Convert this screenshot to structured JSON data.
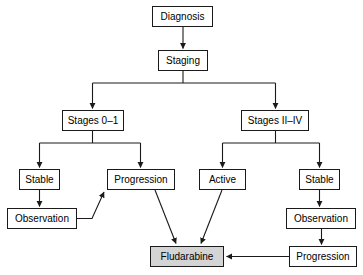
{
  "diagram": {
    "type": "flowchart",
    "colors": {
      "node_fill": "#ffffff",
      "node_fill_highlight": "#d4d4d4",
      "stroke": "#1a1a1a",
      "text": "#000000",
      "background": "#ffffff"
    },
    "nodes": [
      {
        "id": "diagnosis",
        "label": "Diagnosis",
        "x": 152,
        "y": 6,
        "w": 61,
        "h": 21,
        "shaded": false
      },
      {
        "id": "staging",
        "label": "Staging",
        "x": 158,
        "y": 50,
        "w": 50,
        "h": 21,
        "shaded": false
      },
      {
        "id": "stages01",
        "label": "Stages 0–1",
        "x": 62,
        "y": 110,
        "w": 62,
        "h": 21,
        "shaded": false
      },
      {
        "id": "stages2to4",
        "label": "Stages II–IV",
        "x": 241,
        "y": 110,
        "w": 68,
        "h": 21,
        "shaded": false
      },
      {
        "id": "stable-left",
        "label": "Stable",
        "x": 19,
        "y": 169,
        "w": 41,
        "h": 21,
        "shaded": false
      },
      {
        "id": "progression-left",
        "label": "Progression",
        "x": 107,
        "y": 169,
        "w": 68,
        "h": 21,
        "shaded": false
      },
      {
        "id": "active",
        "label": "Active",
        "x": 199,
        "y": 169,
        "w": 47,
        "h": 21,
        "shaded": false
      },
      {
        "id": "stable-right",
        "label": "Stable",
        "x": 299,
        "y": 169,
        "w": 41,
        "h": 21,
        "shaded": false
      },
      {
        "id": "observation-left",
        "label": "Observation",
        "x": 7,
        "y": 208,
        "w": 70,
        "h": 21,
        "shaded": false
      },
      {
        "id": "observation-right",
        "label": "Observation",
        "x": 286,
        "y": 208,
        "w": 70,
        "h": 21,
        "shaded": false
      },
      {
        "id": "progression-right",
        "label": "Progression",
        "x": 289,
        "y": 246,
        "w": 68,
        "h": 21,
        "shaded": false
      },
      {
        "id": "fludarabine",
        "label": "Fludarabine",
        "x": 150,
        "y": 246,
        "w": 74,
        "h": 21,
        "shaded": true
      }
    ],
    "edges": [
      {
        "id": "e-diagnosis-staging",
        "from": "diagnosis",
        "to": "staging",
        "kind": "vertical"
      },
      {
        "id": "e-staging-stages01",
        "from": "staging",
        "to": "stages01",
        "kind": "bus"
      },
      {
        "id": "e-staging-stages2to4",
        "from": "staging",
        "to": "stages2to4",
        "kind": "bus"
      },
      {
        "id": "e-stages01-stable",
        "from": "stages01",
        "to": "stable-left",
        "kind": "bus"
      },
      {
        "id": "e-stages01-progression",
        "from": "stages01",
        "to": "progression-left",
        "kind": "bus"
      },
      {
        "id": "e-stages2to4-active",
        "from": "stages2to4",
        "to": "active",
        "kind": "bus"
      },
      {
        "id": "e-stages2to4-stable",
        "from": "stages2to4",
        "to": "stable-right",
        "kind": "bus"
      },
      {
        "id": "e-stable-observation-left",
        "from": "stable-left",
        "to": "observation-left",
        "kind": "vertical"
      },
      {
        "id": "e-observation-progression-left",
        "from": "observation-left",
        "to": "progression-left",
        "kind": "diagonal"
      },
      {
        "id": "e-progression-fludarabine",
        "from": "progression-left",
        "to": "fludarabine",
        "kind": "diagonal"
      },
      {
        "id": "e-active-fludarabine",
        "from": "active",
        "to": "fludarabine",
        "kind": "diagonal"
      },
      {
        "id": "e-stable-observation-right",
        "from": "stable-right",
        "to": "observation-right",
        "kind": "vertical"
      },
      {
        "id": "e-observation-progression-right",
        "from": "observation-right",
        "to": "progression-right",
        "kind": "vertical"
      },
      {
        "id": "e-progression-right-fludarabine",
        "from": "progression-right",
        "to": "fludarabine",
        "kind": "horizontal"
      }
    ]
  }
}
